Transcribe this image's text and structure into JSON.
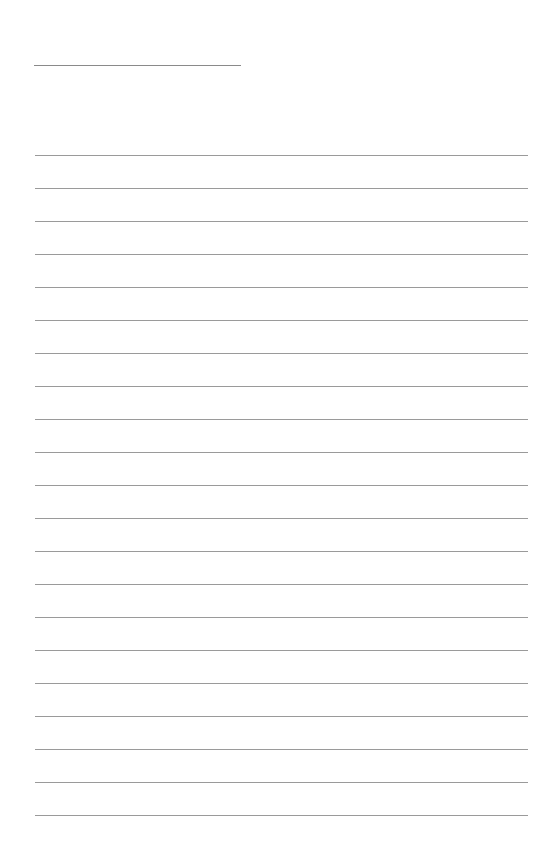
{
  "page": {
    "type": "blank lined paper",
    "background_color": "#ffffff",
    "line_color": "#9a9a9a"
  },
  "title_line": {
    "left": 34,
    "top": 65,
    "width": 207
  },
  "ruled_lines": {
    "count": 21,
    "first_top": 155,
    "spacing": 33,
    "left": 35,
    "width": 493
  }
}
